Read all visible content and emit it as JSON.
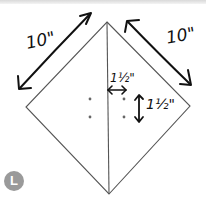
{
  "diagram": {
    "type": "quilt-block-diagram",
    "shape": "square on point (diamond) split vertically into two triangles",
    "labels": {
      "left_edge": "10\"",
      "right_edge": "10\"",
      "horizontal_offset": "1½\"",
      "vertical_spacing": "1½\""
    },
    "dots_count": 4,
    "colors": {
      "line": "#555555",
      "ink": "#111111",
      "badge": "#9a9a9a"
    }
  },
  "badge": {
    "letter": "L"
  }
}
